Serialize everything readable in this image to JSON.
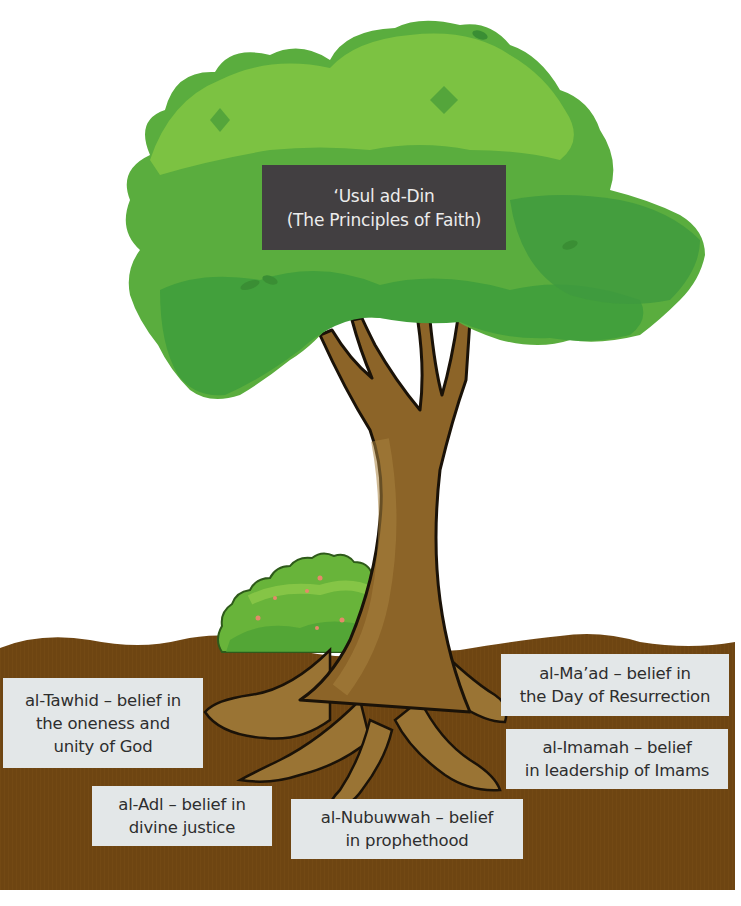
{
  "title": {
    "line1": "‘Usul ad-Din",
    "line2": "(The Principles of Faith)"
  },
  "principles": [
    {
      "id": "tawhid",
      "line1": "al-Tawhid – belief in",
      "line2": "the oneness and",
      "line3": "unity of God"
    },
    {
      "id": "adl",
      "line1": "al-Adl – belief in",
      "line2": "divine justice"
    },
    {
      "id": "nubuwwah",
      "line1": "al-Nubuwwah – belief",
      "line2": "in prophethood"
    },
    {
      "id": "imamah",
      "line1": "al-Imamah – belief",
      "line2": "in leadership of Imams"
    },
    {
      "id": "maad",
      "line1": "al-Ma’ad – belief in",
      "line2": "the Day of Resurrection"
    }
  ],
  "colors": {
    "canopy_light": "#7cc242",
    "canopy_mid": "#5fb040",
    "canopy_dark": "#3f9a3e",
    "trunk": "#8c6428",
    "trunk_light": "#a07a3a",
    "soil": "#6e4512",
    "label_bg": "#e3e7e8",
    "title_bg": "#423f41"
  }
}
